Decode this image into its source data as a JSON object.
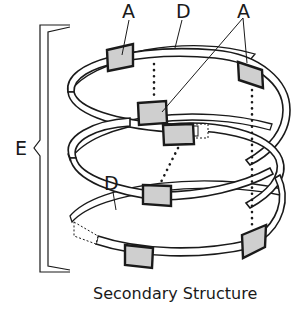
{
  "diagram": {
    "caption": "Secondary Structure",
    "labels": {
      "a_left": "A",
      "d_top": "D",
      "a_right": "A",
      "d_middle": "D",
      "e_bracket": "E"
    },
    "colors": {
      "box_fill": "#cfcfcf",
      "stroke": "#1a1a1a",
      "ribbon_fill": "#ffffff"
    },
    "structure": {
      "type": "helix",
      "turns": 3,
      "residue_boxes": 7,
      "hydrogen_bond_lines": 3
    }
  }
}
